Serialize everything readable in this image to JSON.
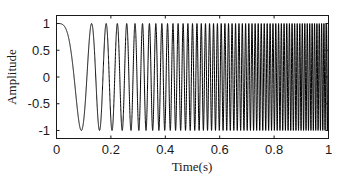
{
  "chart_data": {
    "type": "line",
    "title": "",
    "xlabel": "Time(s)",
    "ylabel": "Amplitude",
    "xlim": [
      0,
      1
    ],
    "ylim": [
      -1.15,
      1.15
    ],
    "xticks": [
      0,
      0.2,
      0.4,
      0.6,
      0.8,
      1
    ],
    "xtick_labels": [
      "0",
      "0.2",
      "0.4",
      "0.6",
      "0.8",
      "1"
    ],
    "yticks": [
      1,
      0.5,
      0,
      -0.5,
      -1
    ],
    "ytick_labels": [
      "1",
      "0.5",
      "0",
      "-0.5",
      "-1"
    ],
    "grid": false,
    "legend": null,
    "series": [
      {
        "name": "chirp signal",
        "description": "Linear chirp y = cos(2*pi*(f0*t + k/2*t^2)), frequency sweeping from 0 Hz to ~120 Hz over 1 s",
        "function": "cos(2*pi*(f0*t + 0.5*k*t^2))",
        "f0_hz": 0,
        "f1_hz": 120,
        "k_hz_per_s": 120,
        "amplitude": 1,
        "t_start": 0,
        "t_end": 1,
        "color": "#000000",
        "sample_points": {
          "t": [
            0,
            0.0913,
            0.129,
            0.1826,
            0.2236,
            0.2582,
            0.2887,
            0.5,
            0.75,
            1.0
          ],
          "y": [
            1,
            -1,
            1,
            1,
            1,
            1,
            1,
            1,
            -1,
            1
          ]
        }
      }
    ]
  }
}
